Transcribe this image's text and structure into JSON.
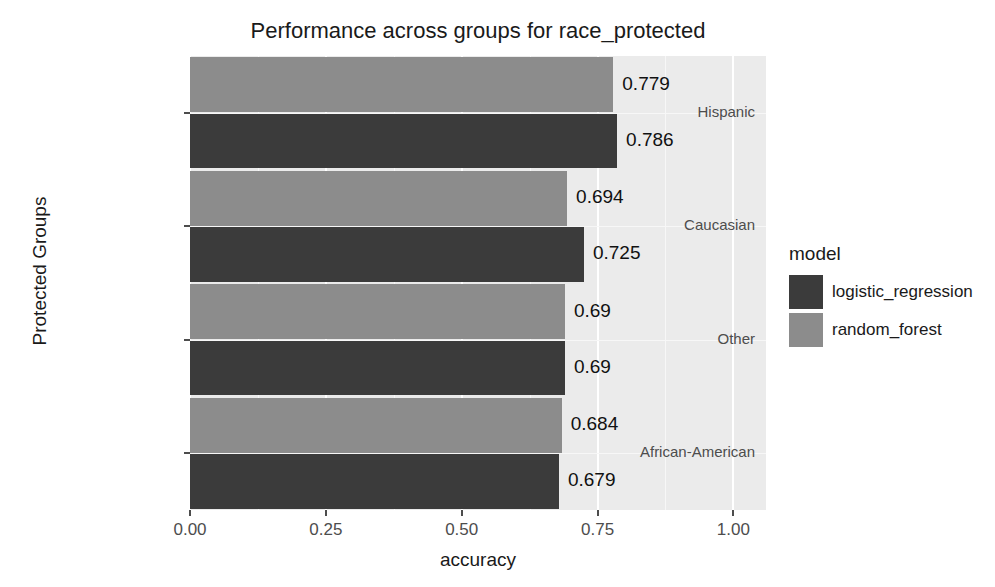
{
  "chart_data": {
    "type": "bar",
    "orientation": "horizontal",
    "title": "Performance across groups for race_protected",
    "xlabel": "accuracy",
    "ylabel": "Protected Groups",
    "categories": [
      "Hispanic",
      "Caucasian",
      "Other",
      "African-American"
    ],
    "series": [
      {
        "name": "logistic_regression",
        "color": "#3b3b3b",
        "values": [
          0.786,
          0.725,
          0.69,
          0.679
        ],
        "labels": [
          "0.786",
          "0.725",
          "0.69",
          "0.679"
        ]
      },
      {
        "name": "random_forest",
        "color": "#8c8c8c",
        "values": [
          0.779,
          0.694,
          0.69,
          0.684
        ],
        "labels": [
          "0.779",
          "0.694",
          "0.69",
          "0.684"
        ]
      }
    ],
    "xlim": [
      0.0,
      1.06
    ],
    "xticks": [
      0.0,
      0.25,
      0.5,
      0.75,
      1.0
    ],
    "xtick_labels": [
      "0.00",
      "0.25",
      "0.50",
      "0.75",
      "1.00"
    ],
    "grid": true,
    "legend_position": "right",
    "legend_title": "model",
    "panel_background": "#ebebeb",
    "gridline_color": "#ffffff"
  }
}
